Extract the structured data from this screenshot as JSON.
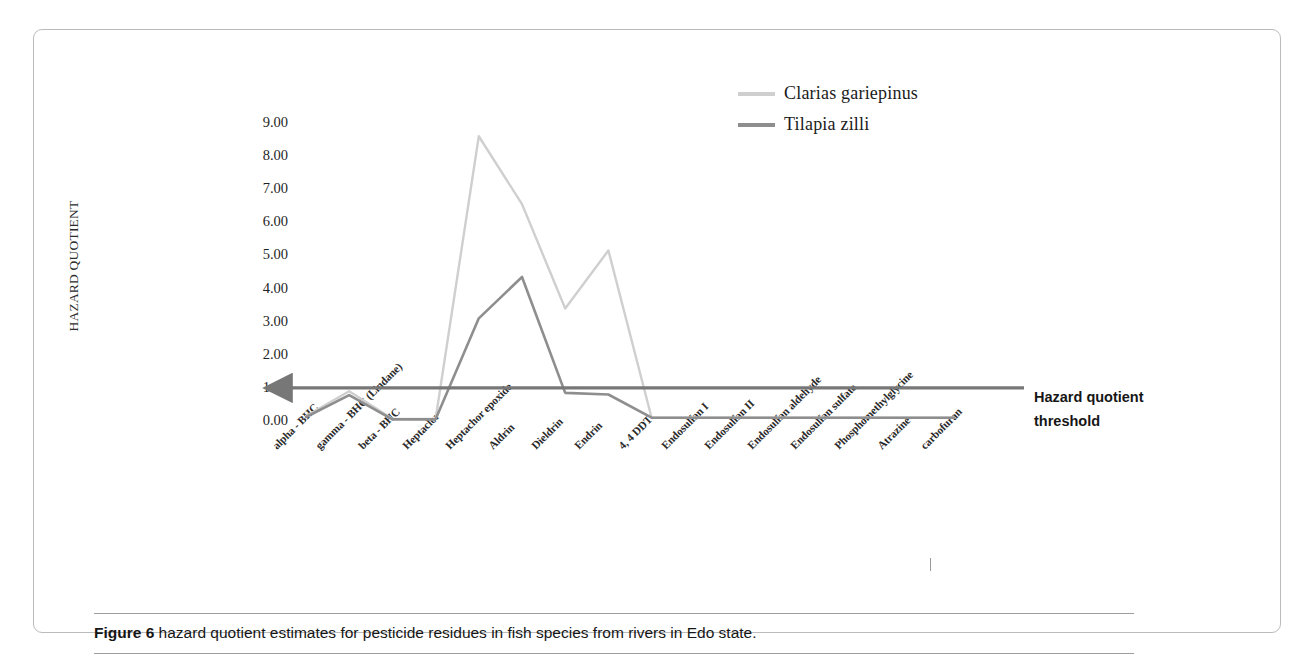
{
  "figure": {
    "caption_label": "Figure 6",
    "caption_text": " hazard quotient estimates for pesticide residues in fish species from rivers in Edo state."
  },
  "annotations": {
    "threshold_line_1": "Hazard quotient",
    "threshold_line_2": "threshold"
  },
  "colors": {
    "series_clarias": "#cfcfcf",
    "series_tilapia": "#8e8e8e",
    "threshold_line": "#777777",
    "frame_border": "#b9bbbd",
    "text": "#1f1f1f"
  },
  "chart_data": {
    "type": "line",
    "title": "",
    "xlabel": "",
    "ylabel": "HAZARD QUOTIENT",
    "ylim": [
      0,
      9
    ],
    "ytick_labels": [
      "0.00",
      "1.00",
      "2.00",
      "3.00",
      "4.00",
      "5.00",
      "6.00",
      "7.00",
      "8.00",
      "9.00"
    ],
    "ytick_values": [
      0,
      1,
      2,
      3,
      4,
      5,
      6,
      7,
      8,
      9
    ],
    "grid": false,
    "legend_position": "top-right",
    "categories": [
      "alpha - BHC",
      "gamma - BHC (Lindane)",
      "beta - BHC",
      "Heptaclor",
      "Heptachor epoxide",
      "Aldrin",
      "Dieldrin",
      "Endrin",
      "4, 4 DDT",
      "Endosulfan I",
      "Endosulfan II",
      "Endosulfan aldehyde",
      "Endosulfan sulfate",
      "Phosphomethylglycine",
      "Atrazine",
      "carbofuran"
    ],
    "series": [
      {
        "name": "Clarias gariepinus",
        "color": "#cfcfcf",
        "values": [
          0.15,
          0.9,
          0.07,
          0.06,
          8.6,
          6.55,
          3.4,
          5.15,
          0.1,
          0.1,
          0.1,
          0.1,
          0.1,
          0.1,
          0.1,
          0.1
        ]
      },
      {
        "name": "Tilapia zilli",
        "color": "#8e8e8e",
        "values": [
          0.12,
          0.78,
          0.05,
          0.05,
          3.1,
          4.35,
          0.85,
          0.8,
          0.1,
          0.1,
          0.1,
          0.1,
          0.1,
          0.1,
          0.1,
          0.1
        ]
      }
    ],
    "threshold": {
      "label": "Hazard quotient threshold",
      "value": 1.0,
      "style": "arrow-line"
    }
  }
}
